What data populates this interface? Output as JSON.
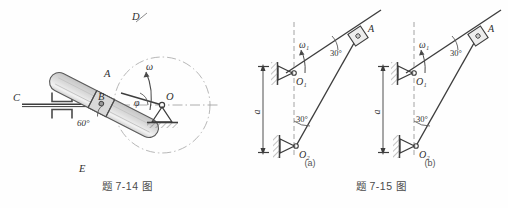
{
  "sheet": {
    "width": 508,
    "height": 208,
    "background": "#fefefe",
    "ink": "#3d3d3d",
    "ink_light": "#8a8a8a"
  },
  "figures": [
    {
      "id": "fig-7-14",
      "caption": "题 7-14 图",
      "description": "Slotted rod DE driven by crank OA rotating about fixed pivot O, connected to horizontal rod C through guides at B",
      "labels": {
        "rod_end_top": "D",
        "rod_end_bottom": "E",
        "slider_point": "A",
        "intersection_point": "B",
        "horizontal_rod": "C",
        "fixed_pivot": "O",
        "angular_velocity": "ω",
        "crank_angle": "φ",
        "slot_angle": "60°"
      }
    },
    {
      "id": "fig-7-15",
      "caption": "题 7-15 图",
      "description": "Two-crank mechanism variants with pivots O1 and O2 separated by distance a, slider block at A",
      "sublabels": {
        "left": "(a)",
        "right": "(b)"
      },
      "labels": {
        "pivot_upper": "O₁",
        "pivot_lower": "O₂",
        "slider_point": "A",
        "angular_velocity": "ω₁",
        "angle_upper": "30°",
        "angle_lower": "30°",
        "distance": "a"
      }
    }
  ],
  "colors": {
    "line": "#3d3d3d",
    "thin_line": "#6f6f6f",
    "dash_line": "#9a9a9a",
    "hatch": "#7a7a7a",
    "rod_fill": "#e8e8e8",
    "rod_shade": "#cfcfcf",
    "text": "#2f2f2f"
  }
}
